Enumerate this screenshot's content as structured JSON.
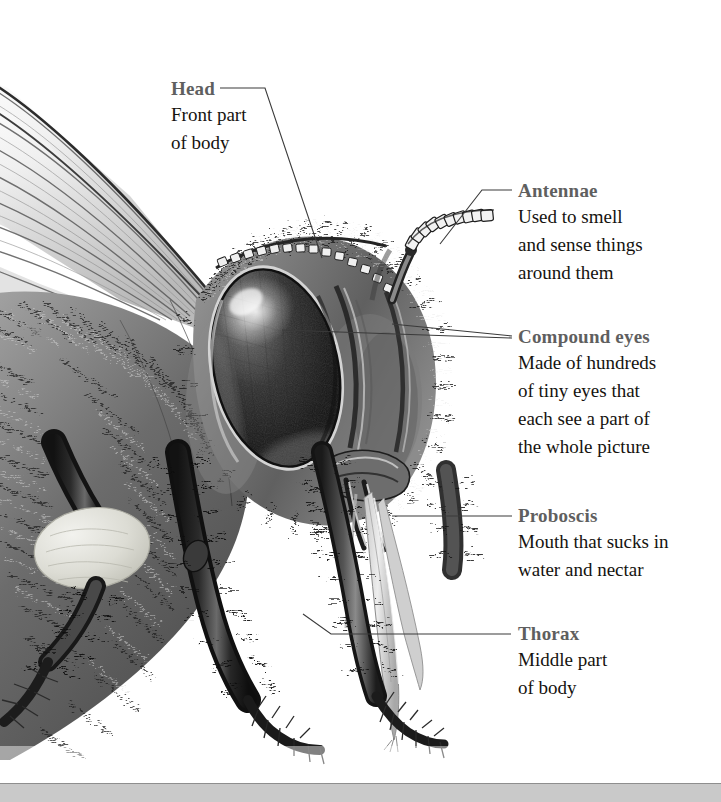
{
  "page": {
    "type": "illustrated-diagram",
    "background_color": "#ffffff",
    "footer_band_color": "#c9c9c9"
  },
  "illustration": {
    "name": "bee-head-illustration",
    "description": "Detailed grayscale pencil drawing of a honey bee's head and thorax in profile, showing wing, compound eye, antenna, proboscis and legs",
    "palette": {
      "darkest": "#1a1a1a",
      "dark": "#3c3c3c",
      "mid": "#6e6e6e",
      "light": "#b4b4b4",
      "lightest": "#e8e8e8",
      "pollen": "#dcdcd4"
    }
  },
  "callouts": [
    {
      "id": "head",
      "heading": "Head",
      "lines": [
        "Front part",
        "of body"
      ],
      "heading_color": "#5f5f5f",
      "body_color": "#15130f"
    },
    {
      "id": "antennae",
      "heading": "Antennae",
      "lines": [
        "Used to smell",
        "and sense things",
        "around them"
      ],
      "heading_color": "#5f5f5f",
      "body_color": "#15130f"
    },
    {
      "id": "compound-eyes",
      "heading": "Compound eyes",
      "lines": [
        "Made of hundreds",
        "of tiny eyes that",
        "each see a part of",
        "the whole picture"
      ],
      "heading_color": "#5f5f5f",
      "body_color": "#15130f"
    },
    {
      "id": "proboscis",
      "heading": "Proboscis",
      "lines": [
        "Mouth that sucks in",
        "water and nectar"
      ],
      "heading_color": "#5f5f5f",
      "body_color": "#15130f"
    },
    {
      "id": "thorax",
      "heading": "Thorax",
      "lines": [
        "Middle part",
        "of body"
      ],
      "heading_color": "#5f5f5f",
      "body_color": "#15130f"
    }
  ]
}
